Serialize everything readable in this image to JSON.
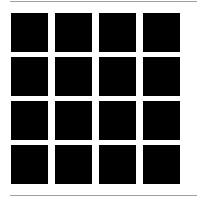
{
  "figure": {
    "rows": 4,
    "columns": 4,
    "cell_color": "#000000",
    "background_color": "#ffffff",
    "rule_color": "#a0a0a0",
    "cells": [
      {
        "row": 1,
        "col": 1
      },
      {
        "row": 1,
        "col": 2
      },
      {
        "row": 1,
        "col": 3
      },
      {
        "row": 1,
        "col": 4
      },
      {
        "row": 2,
        "col": 1
      },
      {
        "row": 2,
        "col": 2
      },
      {
        "row": 2,
        "col": 3
      },
      {
        "row": 2,
        "col": 4
      },
      {
        "row": 3,
        "col": 1
      },
      {
        "row": 3,
        "col": 2
      },
      {
        "row": 3,
        "col": 3
      },
      {
        "row": 3,
        "col": 4
      },
      {
        "row": 4,
        "col": 1
      },
      {
        "row": 4,
        "col": 2
      },
      {
        "row": 4,
        "col": 3
      },
      {
        "row": 4,
        "col": 4
      }
    ]
  }
}
